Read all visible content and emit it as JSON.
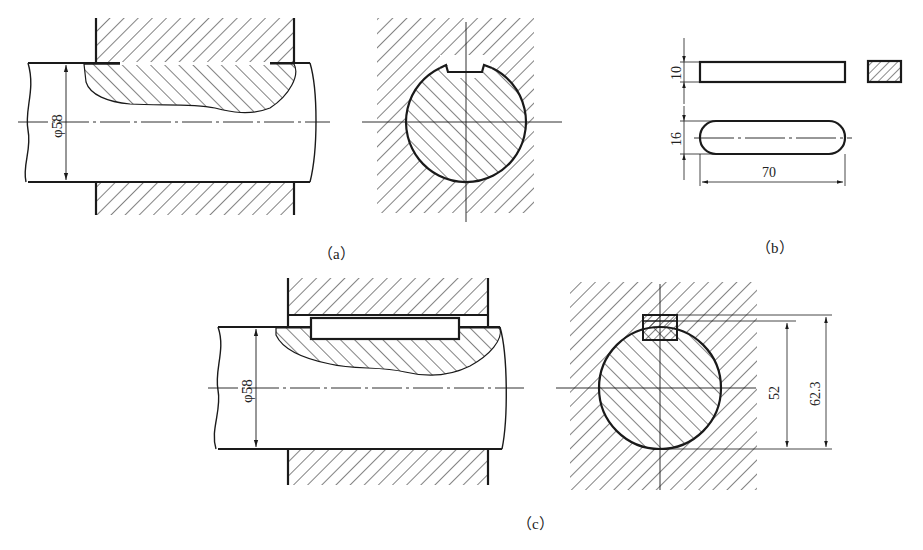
{
  "figure": {
    "panels": [
      {
        "id": "a",
        "caption": "（a）",
        "description": "Shaft Ø58 with keyway, longitudinal section and cross-section inside hub (no key)"
      },
      {
        "id": "b",
        "caption": "（b）",
        "description": "Flat key: side view, end section, top view"
      },
      {
        "id": "c",
        "caption": "（c）",
        "description": "Shaft with key installed, longitudinal section and cross-section with dimensions"
      }
    ],
    "dimensions": {
      "a_shaft_diameter": "φ58",
      "b_key_height": "10",
      "b_key_width": "16",
      "b_key_length": "70",
      "c_shaft_diameter": "φ58",
      "c_keyway_depth_dim": "52",
      "c_total_dim": "62.3"
    },
    "colors": {
      "line": "#1a1a1a",
      "background": "#ffffff"
    }
  }
}
